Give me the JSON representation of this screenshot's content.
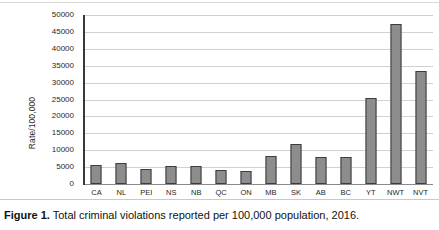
{
  "figure": {
    "caption_label": "Figure 1.",
    "caption_text": " Total criminal violations reported per 100,000 population, 2016."
  },
  "chart_data": {
    "type": "bar",
    "title": "",
    "xlabel": "",
    "ylabel": "Rate/100,000",
    "ylim": [
      0,
      50000
    ],
    "ytick_labels": [
      "50000",
      "45000",
      "40000",
      "35000",
      "30000",
      "25000",
      "20000",
      "15000",
      "10000",
      "5000",
      "0"
    ],
    "ytick_values": [
      50000,
      45000,
      40000,
      35000,
      30000,
      25000,
      20000,
      15000,
      10000,
      5000,
      0
    ],
    "grid": true,
    "legend": "none",
    "bar_color": "#8d8d8d",
    "bar_edge_color": "#3c3c3c",
    "categories": [
      "CA",
      "NL",
      "PEI",
      "NS",
      "NB",
      "QC",
      "ON",
      "MB",
      "SK",
      "AB",
      "BC",
      "YT",
      "NWT",
      "NVT"
    ],
    "values": [
      5600,
      6100,
      4500,
      5400,
      5200,
      4000,
      3800,
      8200,
      11800,
      8000,
      8000,
      25500,
      47200,
      33500
    ]
  }
}
